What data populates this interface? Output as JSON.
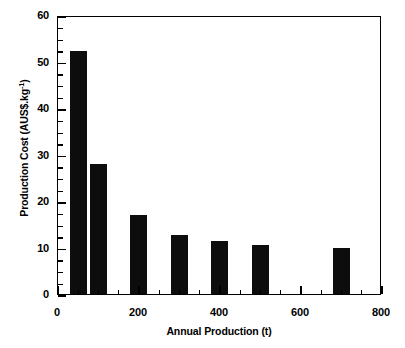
{
  "chart_data": {
    "type": "bar",
    "title": "",
    "subtitle": "",
    "xlabel": "Annual Production (t)",
    "ylabel_text": "Production Cost (AUS$.kg",
    "ylabel_sup": "-1",
    "ylabel_tail": ")",
    "ylabel_full": "Production Cost (AUS$.kg-1)",
    "x": [
      50,
      100,
      200,
      300,
      400,
      500,
      700
    ],
    "values": [
      52.2,
      28.0,
      17.0,
      12.7,
      11.4,
      10.5,
      9.8
    ],
    "categories": [
      "50",
      "100",
      "200",
      "300",
      "400",
      "500",
      "700"
    ],
    "bar_width_t": 42,
    "bar_color": "#0d0d0d",
    "xlim": [
      0,
      800
    ],
    "ylim": [
      0,
      60
    ],
    "xticks": [
      0,
      200,
      400,
      600,
      800
    ],
    "xtick_labels": [
      "0",
      "200",
      "400",
      "600",
      "800"
    ],
    "xminor_step": 50,
    "yticks": [
      0,
      10,
      20,
      30,
      40,
      50,
      60
    ],
    "ytick_labels": [
      "0",
      "10",
      "20",
      "30",
      "40",
      "50",
      "60"
    ],
    "yminor_step": 2.5,
    "grid": false,
    "legend": false,
    "legend_position": "none",
    "series": [
      {
        "name": "Production Cost",
        "values": [
          52.2,
          28.0,
          17.0,
          12.7,
          11.4,
          10.5,
          9.8
        ]
      }
    ]
  },
  "axis_labels": {
    "x_title": "Annual Production (t)",
    "y_title_main": "Production Cost (AUS$.kg",
    "y_title_sup": "-1",
    "y_title_close": ")"
  }
}
